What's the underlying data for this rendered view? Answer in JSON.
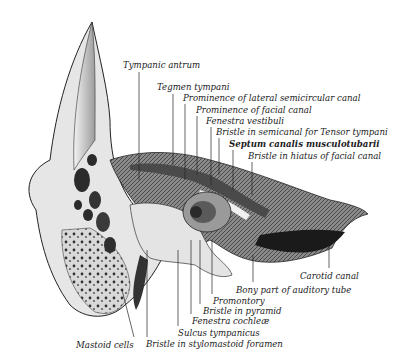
{
  "diagram": {
    "labels": [
      {
        "id": "tympanic-antrum",
        "text": "Tympanic antrum",
        "x": 123,
        "y": 61,
        "lx": 139,
        "ly1": 72,
        "ly2": 180
      },
      {
        "id": "tegmen-tympani",
        "text": "Tegmen tympani",
        "x": 157,
        "y": 83,
        "lx": 173,
        "ly1": 94,
        "ly2": 165
      },
      {
        "id": "prominence-lateral-semicircular-canal",
        "text": "Prominence of lateral semicircular canal",
        "x": 183,
        "y": 94,
        "lx": 185,
        "ly1": 104,
        "ly2": 180
      },
      {
        "id": "prominence-facial-canal",
        "text": "Prominence of facial canal",
        "x": 196,
        "y": 106,
        "lx": 197,
        "ly1": 116,
        "ly2": 175
      },
      {
        "id": "fenestra-vestibuli",
        "text": "Fenestra vestibuli",
        "x": 206,
        "y": 117,
        "lx": 211,
        "ly1": 127,
        "ly2": 185
      },
      {
        "id": "bristle-semicanal-tensor-tympani",
        "text": "Bristle in semicanal for Tensor tympani",
        "x": 216,
        "y": 128,
        "lx": 219,
        "ly1": 138,
        "ly2": 175
      },
      {
        "id": "septum-canalis-musculotubarii",
        "text": "Septum canalis musculotubarii",
        "x": 229,
        "y": 140,
        "lx": 233,
        "ly1": 150,
        "ly2": 190,
        "bold": true
      },
      {
        "id": "bristle-hiatus-facial-canal",
        "text": "Bristle in hiatus of facial canal",
        "x": 248,
        "y": 152,
        "lx": 252,
        "ly1": 162,
        "ly2": 195
      },
      {
        "id": "carotid-canal",
        "text": "Carotid canal",
        "x": 300,
        "y": 272,
        "lx": 329,
        "ly1": 240,
        "ly2": 268
      },
      {
        "id": "bony-part-auditory-tube",
        "text": "Bony part of auditory tube",
        "x": 236,
        "y": 286,
        "lx": 253,
        "ly1": 255,
        "ly2": 282
      },
      {
        "id": "promontory",
        "text": "Promontory",
        "x": 213,
        "y": 297,
        "lx": 212,
        "ly1": 240,
        "ly2": 294
      },
      {
        "id": "bristle-in-pyramid",
        "text": "Bristle in pyramid",
        "x": 203,
        "y": 307,
        "lx": 200,
        "ly1": 240,
        "ly2": 304
      },
      {
        "id": "fenestra-cochleae",
        "text": "Fenestra cochleæ",
        "x": 192,
        "y": 317,
        "lx": 191,
        "ly1": 240,
        "ly2": 314
      },
      {
        "id": "sulcus-tympanicus",
        "text": "Sulcus tympanicus",
        "x": 178,
        "y": 329,
        "lx": 178,
        "ly1": 250,
        "ly2": 326
      },
      {
        "id": "bristle-stylomastoid-foramen",
        "text": "Bristle in stylomastoid foramen",
        "x": 146,
        "y": 340,
        "lx": 147,
        "ly1": 250,
        "ly2": 337
      },
      {
        "id": "mastoid-cells",
        "text": "Mastoid cells",
        "x": 76,
        "y": 341,
        "lx": 134,
        "ly1": 300,
        "ly2": 337
      }
    ]
  }
}
